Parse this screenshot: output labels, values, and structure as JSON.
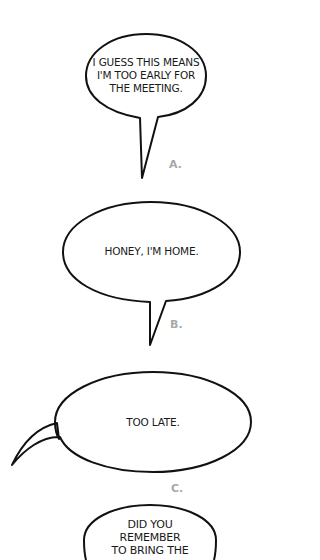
{
  "bubbles": [
    {
      "id": "A",
      "lines": [
        "I GUESS THIS MEANS",
        "I'M TOO EARLY FOR",
        "THE MEETING."
      ],
      "label": "A."
    },
    {
      "id": "B",
      "lines": [
        "HONEY, I'M HOME."
      ],
      "label": "B."
    },
    {
      "id": "C",
      "lines": [
        "TOO LATE."
      ],
      "label": "C."
    },
    {
      "id": "D",
      "lines": [
        "DID YOU",
        "REMEMBER",
        "TO BRING THE"
      ],
      "label": ""
    }
  ],
  "colors": {
    "outline": "#111111",
    "text": "#1a1a1a",
    "label": "#a8a8a8",
    "background": "#ffffff"
  }
}
